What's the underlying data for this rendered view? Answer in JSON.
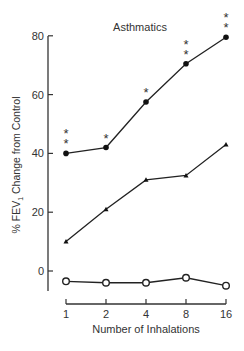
{
  "chart_data": {
    "type": "line",
    "title": "Asthmatics",
    "xlabel": "Number of Inhalations",
    "ylabel": "% FEV1 Change from Control",
    "ylabel_main": "% FEV",
    "ylabel_sub": "1",
    "ylabel_rest": " Change from Control",
    "x": [
      1,
      2,
      4,
      8,
      16
    ],
    "x_tick_labels": [
      "1",
      "2",
      "4",
      "8",
      "16"
    ],
    "y_ticks": [
      0,
      20,
      40,
      60,
      80
    ],
    "y_tick_labels": [
      "0",
      "20",
      "40",
      "60",
      "80"
    ],
    "ylim": [
      -7,
      80
    ],
    "x_scale": "log2",
    "grid": false,
    "legend": null,
    "series": [
      {
        "name": "filled circles",
        "marker": "filled-circle",
        "values": [
          40,
          42,
          57.5,
          70.5,
          79.5
        ],
        "significance": [
          "**",
          "*",
          "*",
          "**",
          "**"
        ]
      },
      {
        "name": "triangles",
        "marker": "triangle",
        "values": [
          10,
          21,
          31,
          32.5,
          43
        ],
        "significance": [
          "",
          "",
          "",
          "",
          ""
        ]
      },
      {
        "name": "open circles",
        "marker": "open-circle",
        "values": [
          -3.5,
          -4,
          -4,
          -2.3,
          -5
        ],
        "significance": [
          "",
          "",
          "",
          "",
          ""
        ]
      }
    ]
  }
}
